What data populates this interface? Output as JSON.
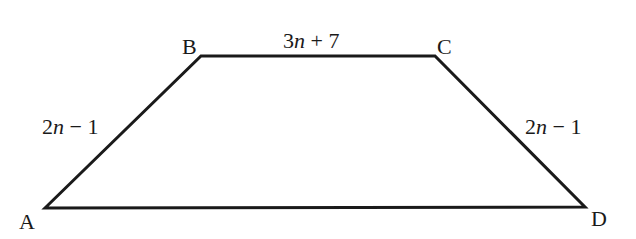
{
  "diagram": {
    "type": "trapezoid",
    "stroke_color": "#1a1a1a",
    "vertices": [
      {
        "label": "A",
        "x": 45,
        "y": 208
      },
      {
        "label": "B",
        "x": 201,
        "y": 56
      },
      {
        "label": "C",
        "x": 435,
        "y": 56
      },
      {
        "label": "D",
        "x": 585,
        "y": 207
      }
    ],
    "sides": {
      "AB": {
        "coef": "2",
        "var": "n",
        "rest": " − 1",
        "full": "2n − 1"
      },
      "BC": {
        "coef": "3",
        "var": "n",
        "rest": " + 7",
        "full": "3n + 7"
      },
      "CD": {
        "coef": "2",
        "var": "n",
        "rest": " − 1",
        "full": "2n − 1"
      },
      "DA": {
        "full": ""
      }
    }
  }
}
